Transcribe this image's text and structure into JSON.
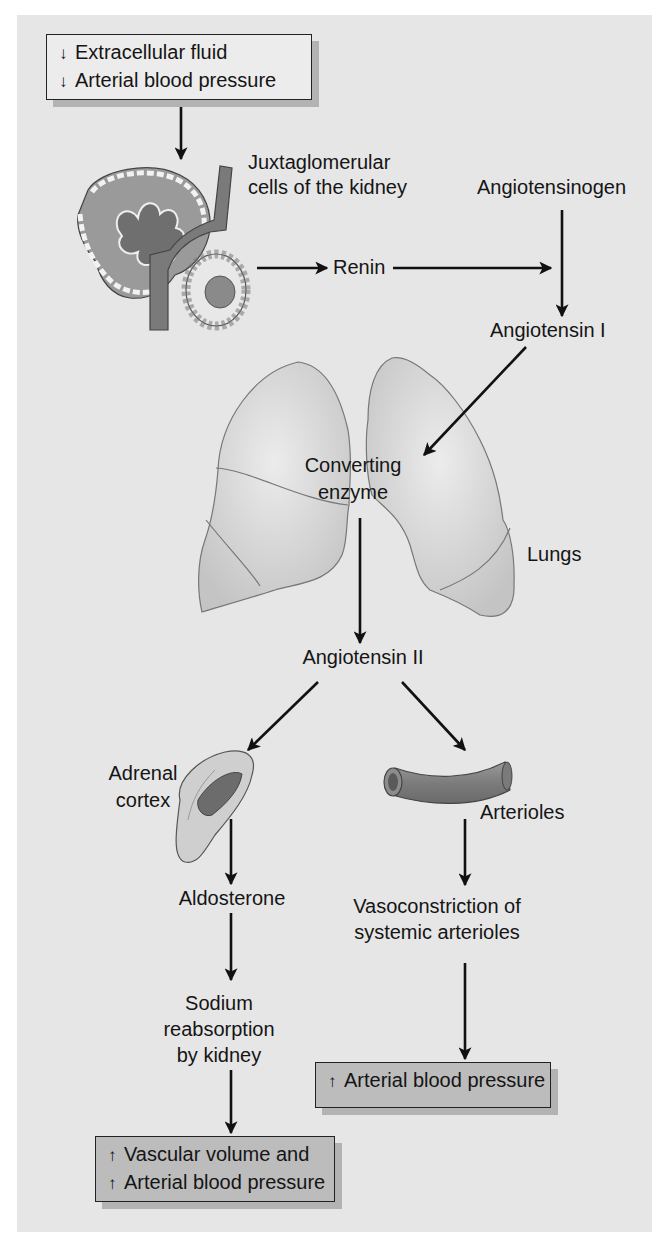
{
  "top_box": {
    "lines": [
      {
        "direction": "down",
        "arrow": "↓",
        "text": "Extracellular fluid"
      },
      {
        "direction": "down",
        "arrow": "↓",
        "text": "Arterial blood pressure"
      }
    ]
  },
  "labels": {
    "jg_cells": [
      "Juxtaglomerular",
      "cells of the kidney"
    ],
    "renin": "Renin",
    "angiotensinogen": "Angiotensinogen",
    "angiotensin_1": "Angiotensin I",
    "converting_enzyme": [
      "Converting",
      "enzyme"
    ],
    "lungs": "Lungs",
    "angiotensin_2": "Angiotensin II",
    "adrenal_cortex": [
      "Adrenal",
      "cortex"
    ],
    "arterioles": "Arterioles",
    "aldosterone": "Aldosterone",
    "vasoconstriction": [
      "Vasoconstriction of",
      "systemic arterioles"
    ],
    "sodium": [
      "Sodium",
      "reabsorption",
      "by kidney"
    ]
  },
  "right_box": {
    "lines": [
      {
        "direction": "up",
        "arrow": "↑",
        "text": "Arterial blood pressure"
      }
    ]
  },
  "left_box": {
    "lines": [
      {
        "direction": "up",
        "arrow": "↑",
        "text": "Vascular volume and"
      },
      {
        "direction": "up",
        "arrow": "↑",
        "text": "Arterial blood pressure"
      }
    ]
  },
  "illustrations": [
    "kidney-juxtaglomerular-apparatus",
    "lungs",
    "adrenal-gland",
    "arteriole-vessel"
  ],
  "colors": {
    "panel_bg": "#e6e6e6",
    "box_fill": "#d9d9d9",
    "box_shadow": "#b3b3b3",
    "arrow": "#111111",
    "tissue": "#8f8f8f"
  }
}
